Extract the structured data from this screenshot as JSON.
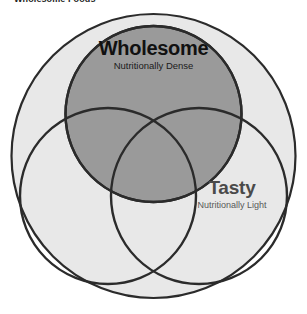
{
  "document": {
    "title": "Wholesome Foods"
  },
  "diagram": {
    "type": "venn",
    "kind": "three-set-venn-in-bounding-circle",
    "background_color": "#ffffff",
    "outer_circle": {
      "name": "universe",
      "fill": "#e8e8e8",
      "stroke": "#2b2b2b",
      "cx": 153.5,
      "cy": 156,
      "r": 142
    },
    "sets": [
      {
        "id": "wholesome",
        "title": "Wholesome",
        "subtitle": "Nutritionally Dense",
        "fill": "#9a9a9a",
        "filled": true,
        "stroke": "#2b2b2b",
        "cx": 153.5,
        "cy": 114,
        "r": 88,
        "title_color": "#111111",
        "subtitle_color": "#1b1b1b"
      },
      {
        "id": "unlabeled-left",
        "title": "",
        "subtitle": "",
        "fill": "none",
        "filled": false,
        "stroke": "#2b2b2b",
        "cx": 108,
        "cy": 196,
        "r": 88,
        "title_color": "",
        "subtitle_color": ""
      },
      {
        "id": "tasty",
        "title": "Tasty",
        "subtitle": "Nutritionally Light",
        "fill": "none",
        "filled": false,
        "stroke": "#2b2b2b",
        "cx": 199,
        "cy": 196,
        "r": 88,
        "title_color": "#4a4a4a",
        "subtitle_color": "#585858"
      }
    ],
    "colors": {
      "page_background": "#ffffff",
      "universe_fill": "#e8e8e8",
      "highlight_fill": "#9a9a9a",
      "outline": "#2b2b2b",
      "title_text": "#111111",
      "secondary_text": "#4a4a4a"
    }
  }
}
